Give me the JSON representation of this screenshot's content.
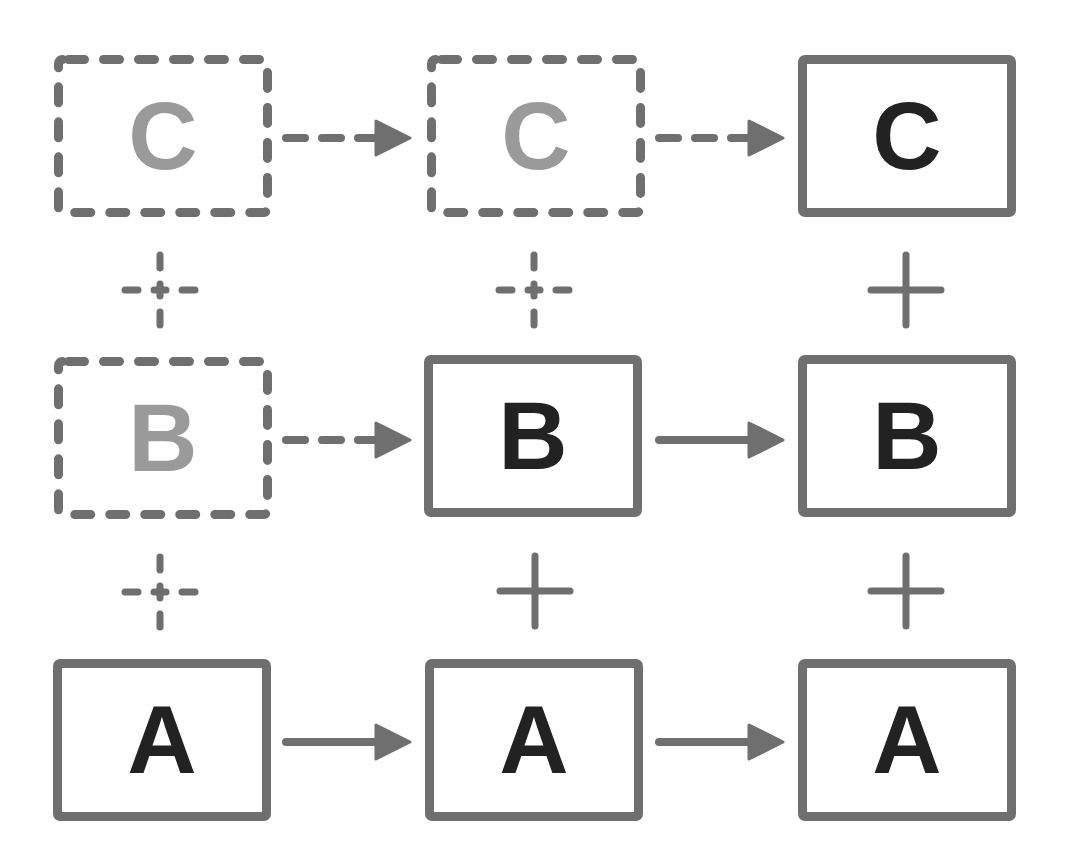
{
  "colors": {
    "border": "#6f6f6f",
    "dark_letter": "#222222",
    "light_letter": "#9a9a9a",
    "background": "#ffffff"
  },
  "grid": {
    "columns": [
      {
        "index": 0,
        "boxes": [
          {
            "row": "top",
            "label": "C",
            "style": "dashed",
            "letter_tone": "light"
          },
          {
            "row": "middle",
            "label": "B",
            "style": "dashed",
            "letter_tone": "light"
          },
          {
            "row": "bottom",
            "label": "A",
            "style": "solid",
            "letter_tone": "dark"
          }
        ],
        "plus_signs": [
          {
            "between": "C-B",
            "style": "dashed"
          },
          {
            "between": "B-A",
            "style": "dashed"
          }
        ]
      },
      {
        "index": 1,
        "boxes": [
          {
            "row": "top",
            "label": "C",
            "style": "dashed",
            "letter_tone": "light"
          },
          {
            "row": "middle",
            "label": "B",
            "style": "solid",
            "letter_tone": "dark"
          },
          {
            "row": "bottom",
            "label": "A",
            "style": "solid",
            "letter_tone": "dark"
          }
        ],
        "plus_signs": [
          {
            "between": "C-B",
            "style": "dashed"
          },
          {
            "between": "B-A",
            "style": "solid"
          }
        ]
      },
      {
        "index": 2,
        "boxes": [
          {
            "row": "top",
            "label": "C",
            "style": "solid",
            "letter_tone": "dark"
          },
          {
            "row": "middle",
            "label": "B",
            "style": "solid",
            "letter_tone": "dark"
          },
          {
            "row": "bottom",
            "label": "A",
            "style": "solid",
            "letter_tone": "dark"
          }
        ],
        "plus_signs": [
          {
            "between": "C-B",
            "style": "solid"
          },
          {
            "between": "B-A",
            "style": "solid"
          }
        ]
      }
    ],
    "arrows": [
      {
        "row": "top",
        "from_col": 0,
        "to_col": 1,
        "style": "dashed"
      },
      {
        "row": "top",
        "from_col": 1,
        "to_col": 2,
        "style": "dashed"
      },
      {
        "row": "middle",
        "from_col": 0,
        "to_col": 1,
        "style": "dashed"
      },
      {
        "row": "middle",
        "from_col": 1,
        "to_col": 2,
        "style": "solid"
      },
      {
        "row": "bottom",
        "from_col": 0,
        "to_col": 1,
        "style": "solid"
      },
      {
        "row": "bottom",
        "from_col": 1,
        "to_col": 2,
        "style": "solid"
      }
    ]
  }
}
